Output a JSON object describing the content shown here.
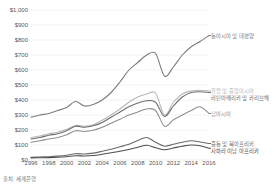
{
  "chart_data": {
    "type": "line",
    "title": "",
    "subtitle": "",
    "xlabel": "",
    "ylabel": "",
    "xlim": [
      1996,
      2016
    ],
    "ylim": [
      0,
      1000
    ],
    "grid": true,
    "legend_position": "right-inline",
    "y_ticks": [
      "$1,000",
      "$900",
      "$800",
      "$700",
      "$600",
      "$500",
      "$400",
      "$300",
      "$200",
      "$100",
      "$0"
    ],
    "y_tick_values": [
      1000,
      900,
      800,
      700,
      600,
      500,
      400,
      300,
      200,
      100,
      0
    ],
    "x_ticks": [
      "1996",
      "1998",
      "2000",
      "2002",
      "2004",
      "2006",
      "2008",
      "2010",
      "2012",
      "2014",
      "2016"
    ],
    "x_tick_values": [
      1996,
      1998,
      2000,
      2002,
      2004,
      2006,
      2008,
      2010,
      2012,
      2014,
      2016
    ],
    "x": [
      1996,
      1997,
      1998,
      1999,
      2000,
      2001,
      2002,
      2003,
      2004,
      2005,
      2006,
      2007,
      2008,
      2009,
      2010,
      2011,
      2012,
      2013,
      2014,
      2015,
      2016
    ],
    "series": [
      {
        "name": "동아시아 및 태평양",
        "color": "#7d7d7f",
        "values": [
          285,
          300,
          310,
          330,
          350,
          390,
          360,
          370,
          400,
          450,
          520,
          600,
          650,
          700,
          710,
          560,
          620,
          700,
          755,
          790,
          830
        ]
      },
      {
        "name": "유럽 및 중앙아시아",
        "color": "#b7b7b9",
        "values": [
          150,
          160,
          175,
          185,
          205,
          230,
          225,
          235,
          265,
          300,
          340,
          385,
          420,
          440,
          445,
          300,
          385,
          440,
          460,
          465,
          460
        ]
      },
      {
        "name": "라틴아메리카 및 카리브해",
        "color": "#6e6e70",
        "values": [
          140,
          150,
          165,
          175,
          195,
          225,
          218,
          228,
          250,
          285,
          320,
          355,
          380,
          395,
          385,
          290,
          360,
          420,
          450,
          455,
          450
        ]
      },
      {
        "name": "남아시아",
        "color": "#8f8f91",
        "values": [
          118,
          128,
          140,
          150,
          168,
          195,
          190,
          198,
          218,
          245,
          272,
          300,
          320,
          340,
          330,
          225,
          268,
          300,
          330,
          355,
          310
        ]
      },
      {
        "name": "중동 및 북아프리카",
        "color": "#6a6a6c",
        "values": [
          18,
          20,
          22,
          26,
          32,
          42,
          40,
          46,
          58,
          72,
          88,
          105,
          130,
          150,
          118,
          92,
          105,
          118,
          128,
          120,
          110
        ]
      },
      {
        "name": "사하라 이남 아프리카",
        "color": "#4e4e50",
        "values": [
          14,
          15,
          16,
          18,
          22,
          28,
          27,
          30,
          38,
          48,
          58,
          70,
          85,
          98,
          82,
          68,
          80,
          92,
          100,
          95,
          78
        ]
      }
    ],
    "source_note": "출처: 세계은행",
    "axis_text_color": "#58585a",
    "grid_color": "#e6e6e6",
    "background": "#ffffff"
  }
}
